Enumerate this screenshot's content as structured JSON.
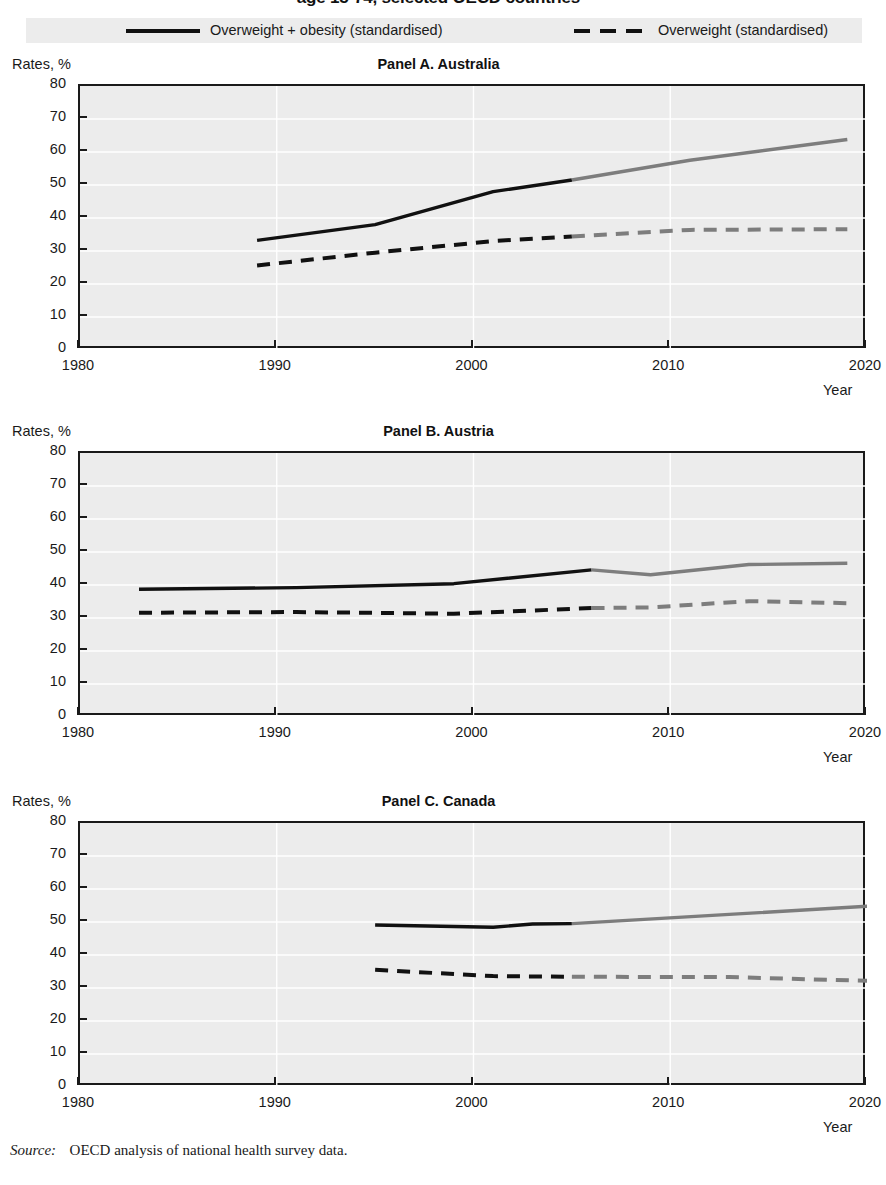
{
  "figure": {
    "title": "age 15-74, selected OECD countries",
    "source_label": "Source:",
    "source_text": "OECD analysis of national health survey data."
  },
  "legend": {
    "items": [
      {
        "label": "Overweight + obesity (standardised)",
        "style": "solid",
        "color": "#111111"
      },
      {
        "label": "Overweight (standardised)",
        "style": "dashed",
        "color": "#111111"
      }
    ]
  },
  "axes": {
    "ylabel": "Rates, %",
    "xlabel": "Year",
    "yticks": [
      "0",
      "10",
      "20",
      "30",
      "40",
      "50",
      "60",
      "70",
      "80"
    ],
    "xticks": [
      "1980",
      "1990",
      "2000",
      "2010",
      "2020"
    ]
  },
  "chart_data": {
    "type": "line",
    "title": "age 15-74, selected OECD countries",
    "xlabel": "Year",
    "ylabel": "Rates, %",
    "xlim": [
      1980,
      2020
    ],
    "ylim": [
      0,
      80
    ],
    "ytick_step": 10,
    "xtick_step": 10,
    "grid": true,
    "grid_color": "#ffffff",
    "plot_background": "#ececec",
    "legend_position": "top",
    "observed_color": "#111111",
    "projected_color": "#7d7d7d",
    "panels": [
      {
        "id": "A",
        "title": "Panel A. Australia",
        "country": "Australia",
        "series": [
          {
            "name": "Overweight + obesity (standardised)",
            "style": "solid",
            "observed": {
              "x": [
                1989,
                1995,
                2001,
                2005
              ],
              "y": [
                33.2,
                38.0,
                48.0,
                51.5
              ]
            },
            "projected": {
              "x": [
                2005,
                2011,
                2019
              ],
              "y": [
                51.5,
                57.5,
                63.8
              ]
            }
          },
          {
            "name": "Overweight (standardised)",
            "style": "dashed",
            "observed": {
              "x": [
                1989,
                1995,
                2001,
                2005
              ],
              "y": [
                25.6,
                29.5,
                33.0,
                34.4
              ]
            },
            "projected": {
              "x": [
                2005,
                2011,
                2019
              ],
              "y": [
                34.4,
                36.4,
                36.6
              ]
            }
          }
        ]
      },
      {
        "id": "B",
        "title": "Panel B. Austria",
        "country": "Austria",
        "series": [
          {
            "name": "Overweight + obesity (standardised)",
            "style": "solid",
            "observed": {
              "x": [
                1983,
                1991,
                1999,
                2006
              ],
              "y": [
                38.7,
                39.2,
                40.4,
                44.6
              ]
            },
            "projected": {
              "x": [
                2006,
                2009,
                2014,
                2019
              ],
              "y": [
                44.6,
                43.1,
                46.2,
                46.6
              ]
            }
          },
          {
            "name": "Overweight (standardised)",
            "style": "dashed",
            "observed": {
              "x": [
                1983,
                1991,
                1999,
                2006
              ],
              "y": [
                31.6,
                31.8,
                31.3,
                33.0
              ]
            },
            "projected": {
              "x": [
                2006,
                2009,
                2014,
                2019
              ],
              "y": [
                33.0,
                33.2,
                35.1,
                34.5
              ]
            }
          }
        ]
      },
      {
        "id": "C",
        "title": "Panel C. Canada",
        "country": "Canada",
        "series": [
          {
            "name": "Overweight + obesity (standardised)",
            "style": "solid",
            "observed": {
              "x": [
                1995,
                2001,
                2003,
                2005
              ],
              "y": [
                49.1,
                48.4,
                49.4,
                49.5
              ]
            },
            "projected": {
              "x": [
                2005,
                2013,
                2021
              ],
              "y": [
                49.5,
                52.3,
                55.1
              ]
            }
          },
          {
            "name": "Overweight (standardised)",
            "style": "dashed",
            "observed": {
              "x": [
                1995,
                2001,
                2003,
                2005
              ],
              "y": [
                35.5,
                33.6,
                33.5,
                33.4
              ]
            },
            "projected": {
              "x": [
                2005,
                2013,
                2021
              ],
              "y": [
                33.4,
                33.3,
                32.0
              ]
            }
          }
        ]
      }
    ]
  }
}
